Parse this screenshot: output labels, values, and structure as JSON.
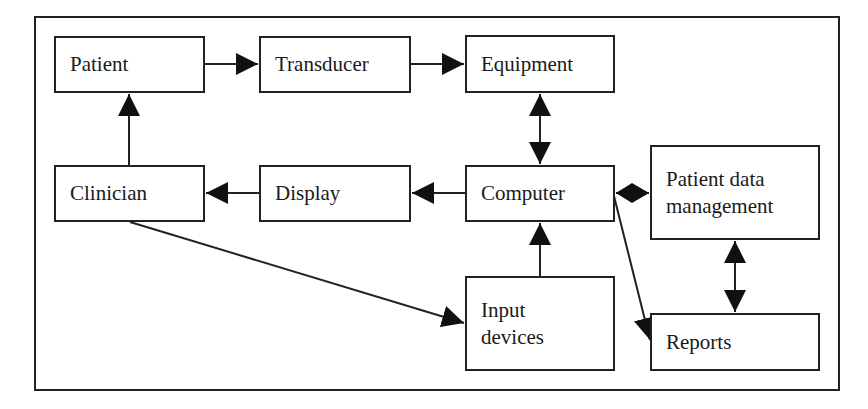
{
  "diagram": {
    "title": "",
    "nodes": [
      {
        "id": "patient",
        "label_lines": [
          "Patient"
        ],
        "x": 54,
        "y": 36,
        "w": 151,
        "h": 57
      },
      {
        "id": "transducer",
        "label_lines": [
          "Transducer"
        ],
        "x": 259,
        "y": 36,
        "w": 152,
        "h": 57
      },
      {
        "id": "equipment",
        "label_lines": [
          "Equipment"
        ],
        "x": 465,
        "y": 35,
        "w": 150,
        "h": 58
      },
      {
        "id": "clinician",
        "label_lines": [
          "Clinician"
        ],
        "x": 54,
        "y": 165,
        "w": 151,
        "h": 57
      },
      {
        "id": "display",
        "label_lines": [
          "Display"
        ],
        "x": 259,
        "y": 165,
        "w": 152,
        "h": 57
      },
      {
        "id": "computer",
        "label_lines": [
          "Computer"
        ],
        "x": 465,
        "y": 165,
        "w": 150,
        "h": 57
      },
      {
        "id": "patient-data-management",
        "label_lines": [
          "Patient data",
          "management"
        ],
        "x": 650,
        "y": 145,
        "w": 170,
        "h": 95
      },
      {
        "id": "input-devices",
        "label_lines": [
          "Input",
          "devices"
        ],
        "x": 465,
        "y": 276,
        "w": 150,
        "h": 95
      },
      {
        "id": "reports",
        "label_lines": [
          "Reports"
        ],
        "x": 650,
        "y": 313,
        "w": 170,
        "h": 58
      }
    ],
    "edges": [
      {
        "from": "patient",
        "to": "transducer",
        "direction": "forward"
      },
      {
        "from": "transducer",
        "to": "equipment",
        "direction": "forward"
      },
      {
        "from": "equipment",
        "to": "computer",
        "direction": "bidirectional"
      },
      {
        "from": "computer",
        "to": "display",
        "direction": "forward"
      },
      {
        "from": "display",
        "to": "clinician",
        "direction": "forward"
      },
      {
        "from": "clinician",
        "to": "patient",
        "direction": "forward"
      },
      {
        "from": "clinician",
        "to": "input-devices",
        "direction": "forward"
      },
      {
        "from": "input-devices",
        "to": "computer",
        "direction": "forward"
      },
      {
        "from": "computer",
        "to": "patient-data-management",
        "direction": "bidirectional"
      },
      {
        "from": "computer",
        "to": "reports",
        "direction": "forward"
      },
      {
        "from": "patient-data-management",
        "to": "reports",
        "direction": "bidirectional"
      }
    ],
    "colors": {
      "stroke": "#222222",
      "background": "#ffffff",
      "text": "#1a1a1a"
    }
  },
  "labels": {
    "patient": [
      "Patient"
    ],
    "transducer": [
      "Transducer"
    ],
    "equipment": [
      "Equipment"
    ],
    "clinician": [
      "Clinician"
    ],
    "display": [
      "Display"
    ],
    "computer": [
      "Computer"
    ],
    "pdm": [
      "Patient data",
      "management"
    ],
    "input": [
      "Input",
      "devices"
    ],
    "reports": [
      "Reports"
    ]
  }
}
